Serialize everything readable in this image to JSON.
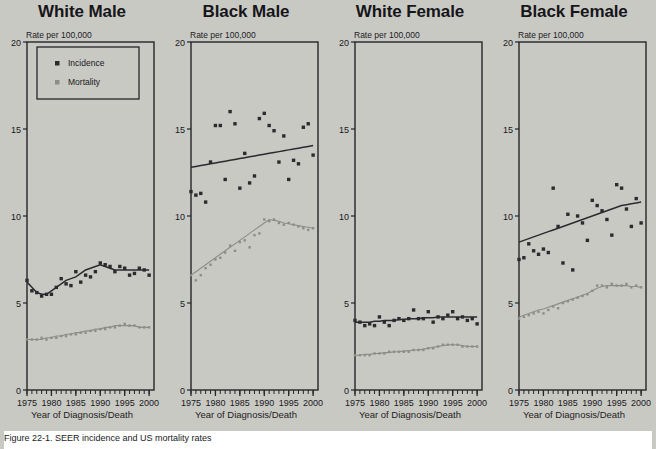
{
  "figure": {
    "background_color": "#c9c9c4",
    "caption": "Figure 22-1.  SEER incidence and US mortality rates",
    "xaxis_title": "Year of Diagnosis/Death",
    "yaxis_unit_label": "Rate per 100,000"
  },
  "legend": {
    "position": "top-left of first panel",
    "entries": [
      {
        "label": "Incidence",
        "marker": "square",
        "color": "#2b2b2f"
      },
      {
        "label": "Mortality",
        "marker": "square",
        "color": "#8d8d88"
      }
    ]
  },
  "chart_data": {
    "type": "scatter",
    "xlabel": "Year of Diagnosis/Death",
    "ylabel": "Rate per 100,000",
    "xlim": [
      1975,
      2001
    ],
    "ylim": [
      0,
      20
    ],
    "xticks": [
      1975,
      1980,
      1985,
      1990,
      1995,
      2000
    ],
    "yticks": [
      0,
      5,
      10,
      15,
      20
    ],
    "grid": false,
    "minor_xticks": "every 1 year",
    "panels": [
      {
        "title": "White Male",
        "x": [
          1975,
          1976,
          1977,
          1978,
          1979,
          1980,
          1981,
          1982,
          1983,
          1984,
          1985,
          1986,
          1987,
          1988,
          1989,
          1990,
          1991,
          1992,
          1993,
          1994,
          1995,
          1996,
          1997,
          1998,
          1999,
          2000
        ],
        "series": [
          {
            "name": "Incidence",
            "color": "#2b2b2f",
            "points": [
              6.3,
              5.7,
              5.6,
              5.4,
              5.5,
              5.5,
              5.9,
              6.4,
              6.1,
              6.0,
              6.8,
              6.2,
              6.6,
              6.5,
              6.8,
              7.3,
              7.2,
              7.1,
              6.8,
              7.1,
              7.0,
              6.6,
              6.7,
              7.0,
              6.9,
              6.6
            ],
            "trend": [
              6.2,
              5.9,
              5.6,
              5.5,
              5.5,
              5.7,
              5.9,
              6.1,
              6.3,
              6.4,
              6.5,
              6.7,
              6.9,
              7.0,
              7.1,
              7.2,
              7.1,
              7.0,
              6.9,
              6.9,
              6.9,
              6.9,
              6.9,
              6.9,
              6.9,
              6.9
            ]
          },
          {
            "name": "Mortality",
            "color": "#8d8d88",
            "points": [
              2.9,
              2.9,
              2.9,
              3.0,
              2.9,
              3.0,
              3.0,
              3.1,
              3.1,
              3.2,
              3.2,
              3.3,
              3.3,
              3.4,
              3.4,
              3.5,
              3.5,
              3.6,
              3.6,
              3.7,
              3.8,
              3.7,
              3.7,
              3.6,
              3.6,
              3.6
            ],
            "trend": [
              2.9,
              2.9,
              2.9,
              2.9,
              3.0,
              3.0,
              3.1,
              3.1,
              3.2,
              3.2,
              3.3,
              3.3,
              3.4,
              3.4,
              3.5,
              3.5,
              3.6,
              3.6,
              3.7,
              3.7,
              3.7,
              3.7,
              3.7,
              3.6,
              3.6,
              3.6
            ]
          }
        ]
      },
      {
        "title": "Black Male",
        "x": [
          1975,
          1976,
          1977,
          1978,
          1979,
          1980,
          1981,
          1982,
          1983,
          1984,
          1985,
          1986,
          1987,
          1988,
          1989,
          1990,
          1991,
          1992,
          1993,
          1994,
          1995,
          1996,
          1997,
          1998,
          1999,
          2000
        ],
        "series": [
          {
            "name": "Incidence",
            "color": "#2b2b2f",
            "points": [
              11.4,
              11.2,
              11.3,
              10.8,
              13.1,
              15.2,
              15.2,
              12.1,
              16.0,
              15.3,
              11.6,
              13.6,
              11.9,
              12.3,
              15.6,
              15.9,
              15.2,
              14.9,
              13.1,
              14.6,
              12.1,
              13.2,
              13.0,
              15.1,
              15.3,
              13.5
            ],
            "trend": [
              12.8,
              12.85,
              12.9,
              12.95,
              13.0,
              13.05,
              13.1,
              13.15,
              13.2,
              13.25,
              13.3,
              13.35,
              13.4,
              13.45,
              13.5,
              13.55,
              13.6,
              13.65,
              13.7,
              13.75,
              13.8,
              13.85,
              13.9,
              13.95,
              14.0,
              14.05
            ]
          },
          {
            "name": "Mortality",
            "color": "#8d8d88",
            "points": [
              6.6,
              6.3,
              6.6,
              7.0,
              7.2,
              7.5,
              7.6,
              7.9,
              8.3,
              8.0,
              8.5,
              8.6,
              8.2,
              8.9,
              9.0,
              9.8,
              9.7,
              9.8,
              9.6,
              9.5,
              9.6,
              9.5,
              9.4,
              9.3,
              9.2,
              9.3
            ],
            "trend": [
              6.6,
              6.8,
              7.0,
              7.2,
              7.4,
              7.6,
              7.8,
              8.0,
              8.2,
              8.4,
              8.6,
              8.8,
              9.0,
              9.2,
              9.4,
              9.6,
              9.8,
              9.75,
              9.7,
              9.6,
              9.55,
              9.5,
              9.45,
              9.4,
              9.35,
              9.3
            ]
          }
        ]
      },
      {
        "title": "White Female",
        "x": [
          1975,
          1976,
          1977,
          1978,
          1979,
          1980,
          1981,
          1982,
          1983,
          1984,
          1985,
          1986,
          1987,
          1988,
          1989,
          1990,
          1991,
          1992,
          1993,
          1994,
          1995,
          1996,
          1997,
          1998,
          1999,
          2000
        ],
        "series": [
          {
            "name": "Incidence",
            "color": "#2b2b2f",
            "points": [
              4.0,
              3.9,
              3.7,
              3.8,
              3.7,
              4.2,
              3.9,
              3.7,
              4.0,
              4.1,
              4.0,
              4.1,
              4.6,
              4.1,
              4.1,
              4.5,
              3.9,
              4.2,
              4.1,
              4.3,
              4.5,
              4.1,
              4.2,
              4.0,
              4.1,
              3.8
            ],
            "trend": [
              3.9,
              3.9,
              3.9,
              3.9,
              3.95,
              3.95,
              4.0,
              4.0,
              4.0,
              4.05,
              4.05,
              4.1,
              4.1,
              4.1,
              4.15,
              4.15,
              4.15,
              4.2,
              4.2,
              4.2,
              4.2,
              4.2,
              4.2,
              4.2,
              4.2,
              4.2
            ]
          },
          {
            "name": "Mortality",
            "color": "#8d8d88",
            "points": [
              2.0,
              2.0,
              2.0,
              2.0,
              2.1,
              2.1,
              2.1,
              2.2,
              2.2,
              2.2,
              2.2,
              2.2,
              2.3,
              2.3,
              2.3,
              2.4,
              2.4,
              2.5,
              2.6,
              2.6,
              2.6,
              2.6,
              2.5,
              2.5,
              2.5,
              2.5
            ],
            "trend": [
              2.0,
              2.0,
              2.05,
              2.05,
              2.1,
              2.1,
              2.15,
              2.15,
              2.2,
              2.2,
              2.25,
              2.25,
              2.3,
              2.3,
              2.35,
              2.4,
              2.45,
              2.5,
              2.55,
              2.6,
              2.6,
              2.6,
              2.55,
              2.5,
              2.5,
              2.5
            ]
          }
        ]
      },
      {
        "title": "Black Female",
        "x": [
          1975,
          1976,
          1977,
          1978,
          1979,
          1980,
          1981,
          1982,
          1983,
          1984,
          1985,
          1986,
          1987,
          1988,
          1989,
          1990,
          1991,
          1992,
          1993,
          1994,
          1995,
          1996,
          1997,
          1998,
          1999,
          2000
        ],
        "series": [
          {
            "name": "Incidence",
            "color": "#2b2b2f",
            "points": [
              7.5,
              7.6,
              8.4,
              8.0,
              7.8,
              8.1,
              7.9,
              11.6,
              9.4,
              7.3,
              10.1,
              6.9,
              10.0,
              9.6,
              8.6,
              10.9,
              10.6,
              10.3,
              9.8,
              8.9,
              11.8,
              11.6,
              10.4,
              9.4,
              11.0,
              9.6
            ],
            "trend": [
              8.5,
              8.6,
              8.7,
              8.8,
              8.9,
              9.0,
              9.1,
              9.2,
              9.3,
              9.4,
              9.5,
              9.6,
              9.7,
              9.8,
              9.9,
              10.0,
              10.1,
              10.2,
              10.3,
              10.4,
              10.5,
              10.6,
              10.65,
              10.7,
              10.75,
              10.8
            ]
          },
          {
            "name": "Mortality",
            "color": "#8d8d88",
            "points": [
              4.1,
              4.2,
              4.3,
              4.4,
              4.5,
              4.4,
              4.6,
              4.8,
              4.7,
              5.0,
              5.1,
              5.2,
              5.3,
              5.4,
              5.5,
              5.7,
              6.0,
              6.0,
              5.9,
              6.1,
              6.0,
              6.0,
              6.1,
              5.9,
              6.0,
              5.9
            ],
            "trend": [
              4.2,
              4.3,
              4.4,
              4.5,
              4.6,
              4.65,
              4.75,
              4.85,
              4.95,
              5.05,
              5.15,
              5.25,
              5.35,
              5.45,
              5.55,
              5.7,
              5.85,
              5.95,
              6.0,
              6.0,
              6.0,
              6.0,
              6.0,
              5.95,
              5.95,
              5.9
            ]
          }
        ]
      }
    ]
  }
}
